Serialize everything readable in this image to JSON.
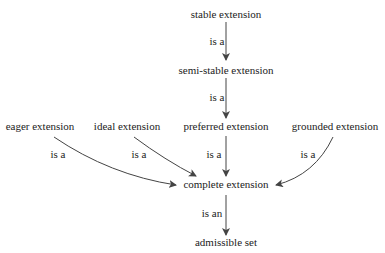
{
  "nodes": {
    "stable": "stable extension",
    "semi_stable": "semi-stable extension",
    "eager": "eager extension",
    "ideal": "ideal extension",
    "preferred": "preferred extension",
    "grounded": "grounded extension",
    "complete": "complete extension",
    "admissible": "admissible set"
  },
  "edges": {
    "stable_semi": "is a",
    "semi_preferred": "is a",
    "eager_complete": "is a",
    "ideal_complete": "is a",
    "preferred_complete": "is a",
    "grounded_complete": "is a",
    "complete_admissible": "is an"
  }
}
